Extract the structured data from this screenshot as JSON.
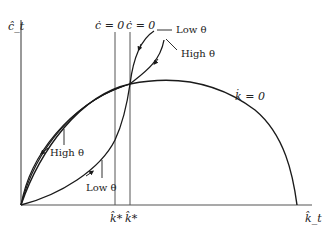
{
  "diagram": {
    "type": "phase-diagram",
    "axes": {
      "y_label": "ĉ_t",
      "x_label": "k̂_t"
    },
    "loci": {
      "c_dot_zero_left": "ċ = 0",
      "c_dot_zero_right": "ċ = 0",
      "k_dot_zero": "k̇ = 0"
    },
    "x_ticks": {
      "k_star_left": "k̂*",
      "k_star_right": "k̂*"
    },
    "annotations": {
      "low_theta_top": "Low θ",
      "high_theta_top": "High θ",
      "high_theta_bottom": "High θ",
      "low_theta_bottom": "Low θ"
    },
    "colors": {
      "curve": "#1a1a1a",
      "axis": "#555555",
      "background": "#ffffff"
    }
  }
}
